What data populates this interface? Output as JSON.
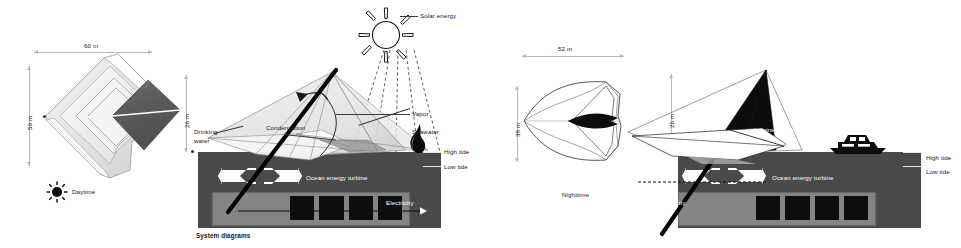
{
  "board": {
    "caption": "System diagrams",
    "background": "#ffffff",
    "ink": "#1a1a1a",
    "dim_color": "#b9b9b9",
    "dark_mass": "#4a4a4a",
    "mid_gray": "#808080",
    "diamond_fill": "#595959"
  },
  "panels": {
    "day_plan": {
      "name": "Daytime plan view",
      "width_dim": "60 m",
      "height_dim": "59 m",
      "legend_label": "Daytime",
      "legend_icon": "sun-icon"
    },
    "day_section": {
      "name": "Daytime system section",
      "height_dim": "26 m",
      "labels": {
        "solar_energy": "Solar energy",
        "vapor": "Vapor",
        "seawater": "Seawater",
        "condensation": "Condensation",
        "drinking_water_line1": "Drinking",
        "drinking_water_line2": "water",
        "high_tide": "High tide",
        "low_tide": "Low tide",
        "ocean_energy_turbine": "Ocean energy turbine",
        "electricity": "Electricity"
      },
      "icons": {
        "sun": "sun-icon",
        "flame": "flame-icon"
      }
    },
    "night_plan": {
      "name": "Nighttime plan view",
      "width_dim": "52 m",
      "height_dim": "38 m",
      "legend_label": "Nighttime",
      "legend_icon": "moon-icon"
    },
    "night_section": {
      "name": "Nighttime system section",
      "height_dim": "26 m",
      "labels": {
        "luminescence": "Luminescence",
        "high_tide": "High tide",
        "low_tide": "Low tide",
        "ocean_energy_turbine": "Ocean energy turbine",
        "electricity": "Electricity"
      },
      "icons": {
        "moon": "moon-icon",
        "boat": "boat-icon"
      }
    }
  }
}
